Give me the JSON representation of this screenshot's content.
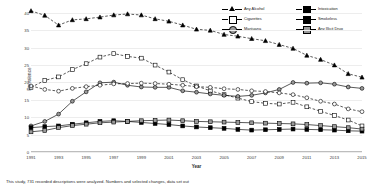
{
  "chart_data": {
    "type": "line",
    "title": "",
    "xlabel": "Year",
    "ylabel": "Prevalence",
    "xlim": [
      1991,
      2015
    ],
    "ylim": [
      0,
      42
    ],
    "ytick_values": [
      0,
      5,
      10,
      15,
      20,
      25,
      30,
      35,
      40
    ],
    "xtick_values": [
      1991,
      1993,
      1995,
      1997,
      1999,
      2001,
      2003,
      2005,
      2007,
      2009,
      2011,
      2013,
      2015
    ],
    "x": [
      1991,
      1992,
      1993,
      1994,
      1995,
      1996,
      1997,
      1998,
      1999,
      2000,
      2001,
      2002,
      2003,
      2004,
      2005,
      2006,
      2007,
      2008,
      2009,
      2010,
      2011,
      2012,
      2013,
      2014,
      2015
    ],
    "grid": true,
    "legend_position": "top-right",
    "series": [
      {
        "name": "Any Alcohol",
        "marker": "triangle-filled",
        "line": "dashed",
        "values": [
          40.6,
          39.3,
          36.5,
          38.0,
          38.3,
          38.8,
          39.4,
          39.7,
          39.4,
          38.3,
          37.6,
          36.5,
          35.3,
          35.0,
          33.8,
          33.3,
          32.6,
          32.0,
          30.9,
          29.8,
          27.8,
          26.6,
          25.0,
          22.5,
          21.5
        ]
      },
      {
        "name": "Cigarettes",
        "marker": "square-open",
        "line": "dashed",
        "values": [
          18.6,
          20.6,
          21.6,
          23.7,
          25.4,
          27.3,
          28.3,
          27.5,
          27.0,
          25.0,
          23.0,
          20.8,
          19.0,
          17.6,
          16.5,
          15.5,
          14.5,
          14.0,
          13.8,
          14.3,
          13.0,
          11.7,
          10.5,
          9.2,
          7.5
        ]
      },
      {
        "name": "Marijuana",
        "marker": "circle-grey",
        "line": "solid",
        "values": [
          7.5,
          8.8,
          10.9,
          14.6,
          17.3,
          19.9,
          20.1,
          19.2,
          18.7,
          18.6,
          18.6,
          17.6,
          17.2,
          16.7,
          16.3,
          16.0,
          16.3,
          17.0,
          18.0,
          20.0,
          19.8,
          19.9,
          19.5,
          18.7,
          18.3
        ]
      },
      {
        "name": "Intoxication",
        "marker": "circle-open",
        "line": "dashed",
        "values": [
          19.0,
          18.0,
          17.5,
          18.3,
          18.8,
          19.2,
          19.6,
          19.7,
          19.8,
          19.7,
          19.5,
          19.2,
          18.8,
          18.6,
          18.2,
          18.0,
          17.6,
          17.4,
          17.0,
          16.5,
          15.6,
          14.6,
          13.8,
          12.4,
          11.6
        ]
      },
      {
        "name": "Smokeless",
        "marker": "square-filled",
        "line": "solid",
        "values": [
          7.0,
          7.3,
          7.5,
          8.0,
          8.4,
          8.8,
          9.0,
          8.8,
          8.5,
          8.2,
          7.9,
          7.5,
          7.2,
          7.0,
          6.8,
          6.5,
          6.3,
          6.4,
          6.5,
          6.6,
          6.5,
          6.4,
          6.3,
          6.1,
          6.0
        ]
      },
      {
        "name": "Any Illicit Drug",
        "marker": "square-grey",
        "line": "solid",
        "values": [
          5.8,
          6.2,
          7.0,
          7.6,
          8.0,
          8.4,
          8.6,
          8.8,
          9.0,
          9.1,
          9.2,
          9.0,
          8.8,
          8.7,
          8.6,
          8.5,
          8.4,
          8.3,
          8.2,
          8.1,
          7.9,
          7.6,
          7.3,
          7.0,
          6.6
        ]
      }
    ]
  },
  "caption": "This study, 731 recorded descriptions were analyzed. Numbers and selected changes, data set out"
}
